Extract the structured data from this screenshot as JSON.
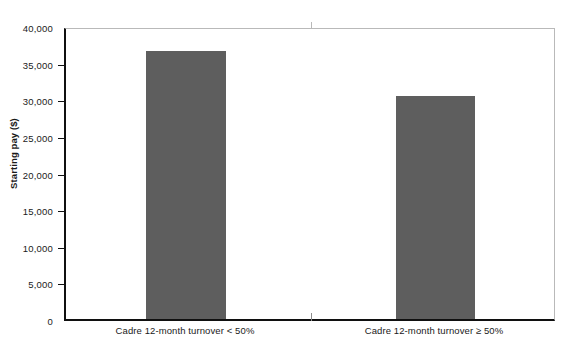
{
  "chart_data": {
    "type": "bar",
    "title": "",
    "xlabel": "",
    "ylabel": "Starting pay ($)",
    "categories": [
      "Cadre 12-month turnover < 50%",
      "Cadre 12-month turnover ≥ 50%"
    ],
    "values": [
      37000,
      30800
    ],
    "ylim": [
      0,
      40000
    ],
    "yticks": [
      0,
      5000,
      10000,
      15000,
      20000,
      25000,
      30000,
      35000,
      40000
    ],
    "ytick_labels": [
      "0",
      "5,000",
      "10,000",
      "15,000",
      "20,000",
      "25,000",
      "30,000",
      "35,000",
      "40,000"
    ],
    "grid": false,
    "legend": null,
    "legend_position": "none",
    "series": [
      {
        "name": "Starting pay",
        "values": [
          37000,
          30800
        ],
        "color": "#5e5e5e"
      }
    ],
    "colors": {
      "bar": "#5e5e5e",
      "axis": "#101010",
      "plot_border": "#b9b9b9",
      "text": "#1a1a1a",
      "background": "#ffffff"
    }
  }
}
